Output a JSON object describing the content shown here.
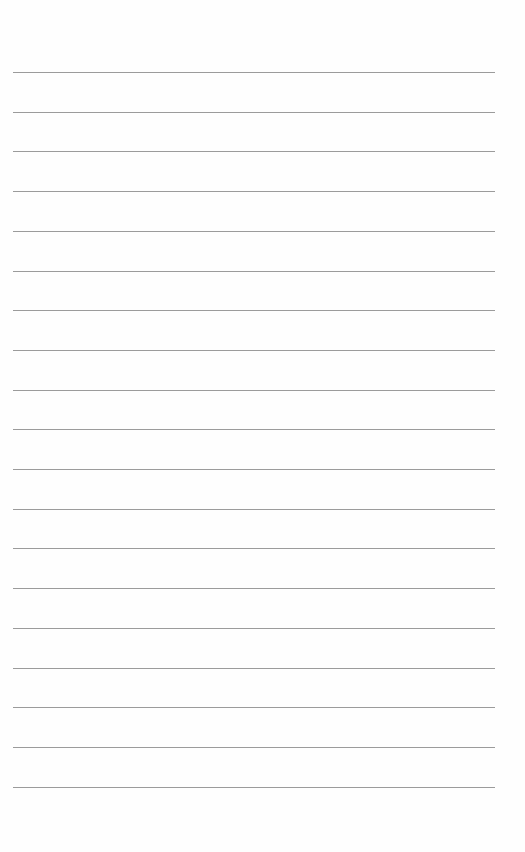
{
  "page": {
    "type": "blank-ruled-page",
    "background_color": "#fefefe",
    "rule_color": "#8a8a8a",
    "rule_count": 19,
    "first_rule_y": 72,
    "rule_spacing": 39.7,
    "rule_left": 13,
    "rule_right": 495,
    "lines": [
      "",
      "",
      "",
      "",
      "",
      "",
      "",
      "",
      "",
      "",
      "",
      "",
      "",
      "",
      "",
      "",
      "",
      "",
      ""
    ]
  }
}
